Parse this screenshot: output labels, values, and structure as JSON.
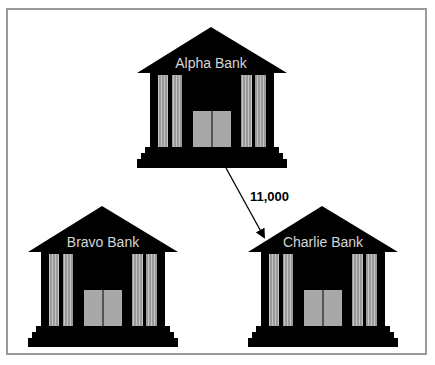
{
  "diagram": {
    "banks": [
      {
        "id": "alpha",
        "label": "Alpha Bank"
      },
      {
        "id": "bravo",
        "label": "Bravo Bank"
      },
      {
        "id": "charlie",
        "label": "Charlie Bank"
      }
    ],
    "transfers": [
      {
        "from": "alpha",
        "to": "charlie",
        "amount_label": "11,000"
      }
    ],
    "colors": {
      "building": "#000000",
      "column": "#9a9a9a",
      "column_stripe": "#c8c8c8",
      "door": "#a8a8a8",
      "label": "#d6d6d6",
      "frame": "#9a9a9a"
    }
  }
}
